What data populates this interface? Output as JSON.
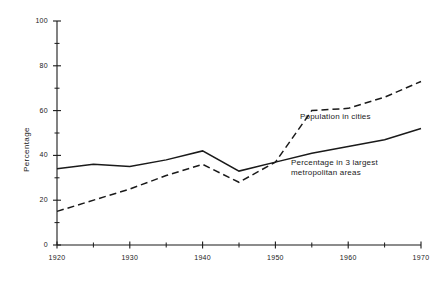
{
  "chart_data": {
    "type": "line",
    "title": "",
    "xlabel": "",
    "ylabel": "Percentage",
    "xlim": [
      1920,
      1970
    ],
    "ylim": [
      0,
      100
    ],
    "grid": false,
    "legend_position": "inline-annotations",
    "x_ticks_major": [
      1920,
      1930,
      1940,
      1950,
      1960,
      1970
    ],
    "x_ticks_minor": [
      1925,
      1935,
      1945,
      1955,
      1965
    ],
    "x_tick_labels": [
      "1920",
      "1930",
      "1940",
      "1950",
      "1960",
      "1970"
    ],
    "y_ticks_major": [
      0,
      20,
      40,
      60,
      80,
      100
    ],
    "y_ticks_minor": [
      10,
      30,
      50,
      70,
      90
    ],
    "y_tick_labels": [
      "0",
      "20",
      "40",
      "60",
      "80",
      "100"
    ],
    "series": [
      {
        "name": "Population in cities",
        "style": "dashed",
        "color": "#1a1a1a",
        "x": [
          1920,
          1930,
          1935,
          1940,
          1945,
          1950,
          1955,
          1960,
          1965,
          1970
        ],
        "values": [
          15,
          25,
          31,
          36,
          28,
          37,
          60,
          61,
          66,
          73
        ]
      },
      {
        "name": "Percentage in 3 largest metropolitan areas",
        "style": "solid",
        "color": "#1a1a1a",
        "x": [
          1920,
          1925,
          1930,
          1935,
          1940,
          1945,
          1950,
          1955,
          1960,
          1965,
          1970
        ],
        "values": [
          34,
          36,
          35,
          38,
          42,
          33,
          37,
          41,
          44,
          47,
          52
        ]
      }
    ],
    "annotations": [
      {
        "id": "population-in-cities",
        "text": "Population in cities",
        "x_px": 300,
        "y_px": 112
      },
      {
        "id": "metropolitan-areas",
        "text": "Percentage in 3 largest\nmetropolitan areas",
        "x_px": 291,
        "y_px": 158
      }
    ]
  },
  "axis": {
    "y_title": "Percentage"
  }
}
